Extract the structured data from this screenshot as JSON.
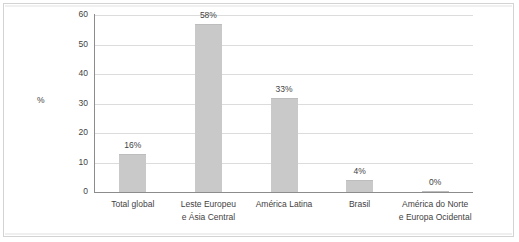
{
  "chart_data": {
    "type": "bar",
    "title": "",
    "subtitle": "",
    "xlabel": "",
    "ylabel": "%",
    "ylim": [
      0,
      60
    ],
    "yticks": [
      "0",
      "10",
      "20",
      "30",
      "40",
      "50",
      "60"
    ],
    "grid": true,
    "legend": false,
    "orientation": "vertical",
    "bar_color": "#c9c9c9",
    "axis_color": "#8c8c8c",
    "grid_color": "#dcdcdc",
    "text_color": "#3f3f3f",
    "categories": [
      "Total global",
      "Leste Europeu e Ásia Central",
      "América Latina",
      "Brasil",
      "América do Norte e Europa Ocidental"
    ],
    "category_lines": [
      [
        "Total global"
      ],
      [
        "Leste Europeu",
        "e Ásia Central"
      ],
      [
        "América Latina"
      ],
      [
        "Brasil"
      ],
      [
        "América do Norte",
        "e Europa Ocidental"
      ]
    ],
    "values": [
      16,
      58,
      33,
      4,
      0
    ],
    "plotted_heights": [
      13,
      57,
      32,
      4,
      0.5
    ],
    "data_labels": [
      "16%",
      "58%",
      "33%",
      "4%",
      "0%"
    ]
  }
}
